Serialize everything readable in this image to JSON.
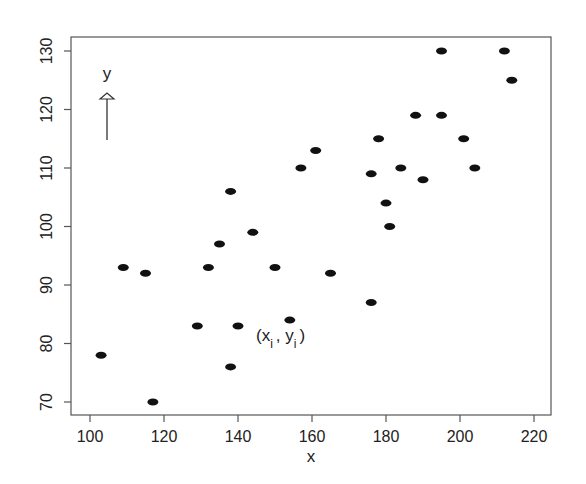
{
  "chart_data": {
    "type": "scatter",
    "title": "",
    "xlabel": "x",
    "ylabel": "",
    "xlim": [
      95,
      225
    ],
    "ylim": [
      68,
      132
    ],
    "x_ticks": [
      100,
      120,
      140,
      160,
      180,
      200,
      220
    ],
    "y_ticks": [
      70,
      80,
      90,
      100,
      110,
      120,
      130
    ],
    "grid": false,
    "legend": null,
    "annotations": [
      {
        "text": "y",
        "type": "arrow-label",
        "x": 105,
        "y": 124.5,
        "note": "upward arrow indicating y direction"
      },
      {
        "text": "(x_i , y_i)",
        "type": "point-label",
        "x": 160,
        "y": 82
      }
    ],
    "points": [
      {
        "x": 103,
        "y": 78
      },
      {
        "x": 109,
        "y": 93
      },
      {
        "x": 115,
        "y": 92
      },
      {
        "x": 117,
        "y": 70
      },
      {
        "x": 129,
        "y": 83
      },
      {
        "x": 132,
        "y": 93
      },
      {
        "x": 135,
        "y": 97
      },
      {
        "x": 138,
        "y": 106
      },
      {
        "x": 138,
        "y": 76
      },
      {
        "x": 140,
        "y": 83
      },
      {
        "x": 144,
        "y": 99
      },
      {
        "x": 150,
        "y": 93
      },
      {
        "x": 154,
        "y": 84
      },
      {
        "x": 157,
        "y": 110
      },
      {
        "x": 161,
        "y": 113
      },
      {
        "x": 165,
        "y": 92
      },
      {
        "x": 176,
        "y": 109
      },
      {
        "x": 176,
        "y": 87
      },
      {
        "x": 178,
        "y": 115
      },
      {
        "x": 180,
        "y": 104
      },
      {
        "x": 181,
        "y": 100
      },
      {
        "x": 184,
        "y": 110
      },
      {
        "x": 188,
        "y": 119
      },
      {
        "x": 190,
        "y": 108
      },
      {
        "x": 195,
        "y": 130
      },
      {
        "x": 195,
        "y": 119
      },
      {
        "x": 201,
        "y": 115
      },
      {
        "x": 204,
        "y": 110
      },
      {
        "x": 212,
        "y": 130
      },
      {
        "x": 214,
        "y": 125
      }
    ]
  },
  "labels": {
    "x_axis_title": "x",
    "y_arrow_label": "y",
    "point_label_open": "(x",
    "point_label_sub_i1": "i",
    "point_label_mid": ", y",
    "point_label_sub_i2": "i",
    "point_label_close": ")"
  },
  "colors": {
    "point": "#111111",
    "axis": "#555555",
    "text": "#222222"
  }
}
